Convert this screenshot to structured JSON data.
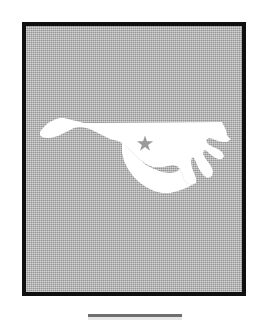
{
  "figure": {
    "kind": "state-locator-map",
    "frame": {
      "border_color": "#101010",
      "border_width_px": 4,
      "background_color": "#a9a9a9",
      "x": 22,
      "y": 22,
      "width": 224,
      "height": 274
    },
    "state_shape": {
      "name": "state-outline",
      "fill_color": "#ffffff",
      "label": "North Carolina"
    },
    "capital_marker": {
      "name": "capital-star",
      "symbol": "star",
      "label": "Raleigh",
      "fill_color": "#9a9a9a",
      "x": 145,
      "y": 142,
      "size_px": 13
    },
    "bottom_rule": {
      "name": "caption-rule",
      "color": "#6f6f6f",
      "x": 88,
      "y": 314,
      "width": 94,
      "height": 3
    }
  },
  "page": {
    "background_color": "#ffffff",
    "width": 267,
    "height": 320
  }
}
